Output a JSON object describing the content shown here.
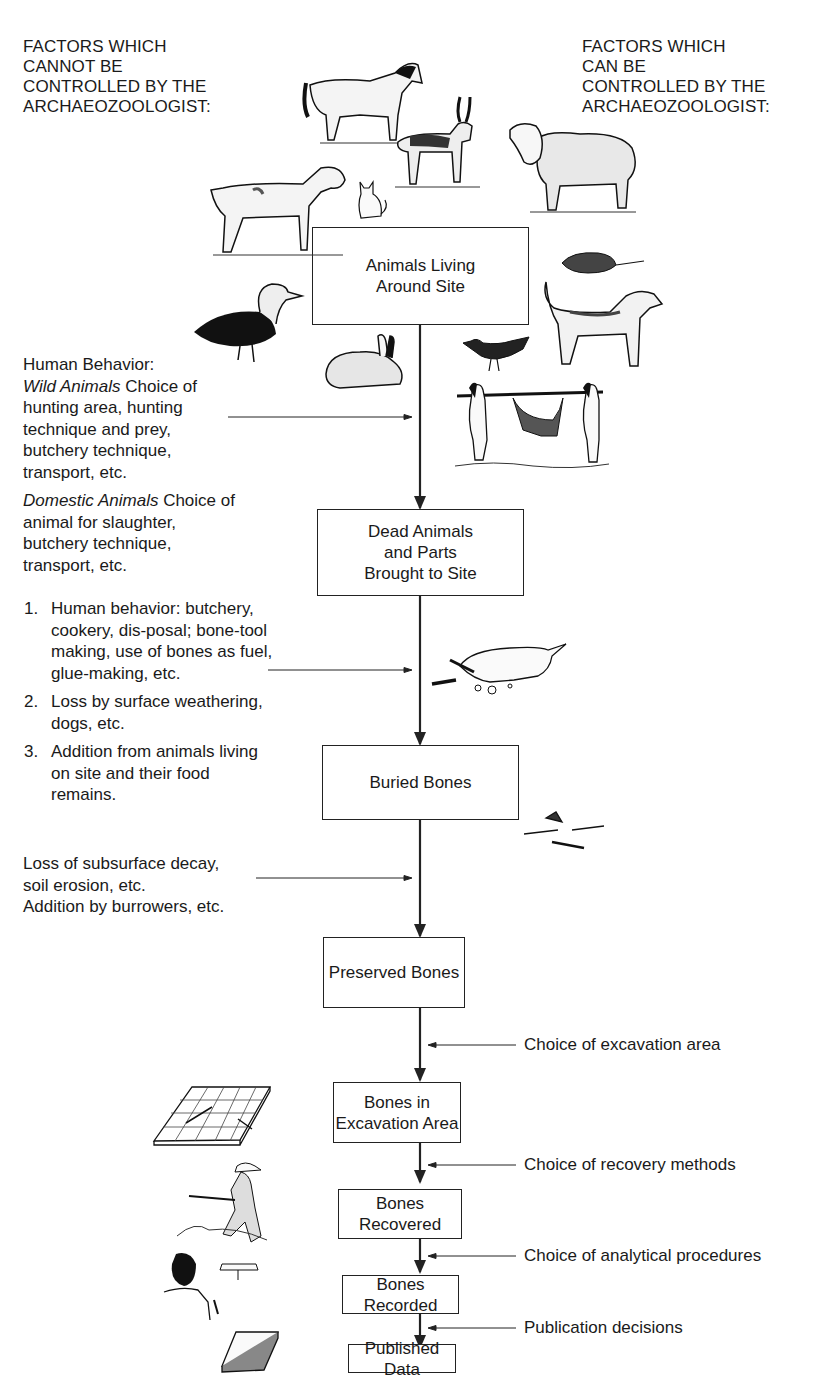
{
  "headers": {
    "left": [
      "FACTORS WHICH",
      "CANNOT BE",
      "CONTROLLED BY THE",
      "ARCHAEOZOOLOGIST:"
    ],
    "right": [
      "FACTORS WHICH",
      "CAN BE",
      "CONTROLLED BY THE",
      "ARCHAEOZOOLOGIST:"
    ]
  },
  "boxes": [
    {
      "id": "animals-living",
      "lines": [
        "Animals Living",
        "Around Site"
      ]
    },
    {
      "id": "dead-animals",
      "lines": [
        "Dead Animals",
        "and Parts",
        "Brought to Site"
      ]
    },
    {
      "id": "buried-bones",
      "lines": [
        "Buried Bones"
      ]
    },
    {
      "id": "preserved-bones",
      "lines": [
        "Preserved Bones"
      ]
    },
    {
      "id": "bones-excavation",
      "lines": [
        "Bones in",
        "Excavation Area"
      ]
    },
    {
      "id": "bones-recovered",
      "lines": [
        "Bones Recovered"
      ]
    },
    {
      "id": "bones-recorded",
      "lines": [
        "Bones Recorded"
      ]
    },
    {
      "id": "published-data",
      "lines": [
        "Published Data"
      ]
    }
  ],
  "left_factors": {
    "human_behavior": {
      "title": "Human Behavior:",
      "wild_label": "Wild Animals",
      "wild_text": " Choice of hunting area, hunting technique and prey, butchery technique, transport, etc.",
      "domestic_label": "Domestic Animals",
      "domestic_text": " Choice of animal for slaughter, butchery technique, transport, etc."
    },
    "site_processes": [
      {
        "num": "1.",
        "text": "Human behavior: butchery, cookery, dis-posal; bone-tool making, use of bones as fuel, glue-making, etc."
      },
      {
        "num": "2.",
        "text": "Loss by surface weathering, dogs, etc."
      },
      {
        "num": "3.",
        "text": "Addition from animals living on site and their food remains."
      }
    ],
    "burial": {
      "line1": "Loss of subsurface decay,",
      "line2": "soil erosion, etc.",
      "line3": "Addition by burrowers, etc."
    }
  },
  "right_factors": [
    "Choice of excavation area",
    "Choice of recovery methods",
    "Choice of analytical procedures",
    "Publication decisions"
  ],
  "illustrations": [
    "horse",
    "antelope",
    "sheep",
    "goat",
    "cat",
    "rat",
    "dog",
    "duck",
    "rabbit",
    "bird",
    "hunters-carrying-prey",
    "dog-gnawing-bones",
    "scattered-bones",
    "excavation-grid",
    "excavator-kneeling",
    "analyst-recording",
    "published-book"
  ]
}
